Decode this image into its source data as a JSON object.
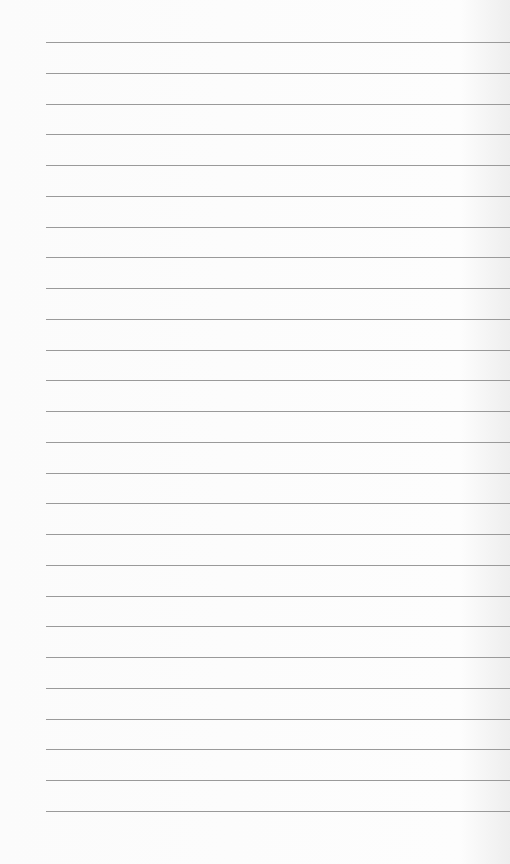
{
  "page": {
    "type": "lined-paper",
    "line_count": 26,
    "first_line_y": 42,
    "line_spacing": 30.76,
    "line_left": 46,
    "line_color": "#9a9a9a",
    "background": "#fbfbfb"
  }
}
